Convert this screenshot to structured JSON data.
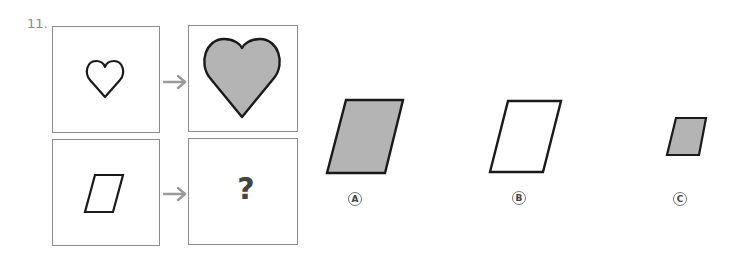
{
  "question": {
    "number": "11.",
    "matrix": {
      "top_left": {
        "shape": "heart",
        "fill": "none",
        "size": "small"
      },
      "top_right": {
        "shape": "heart",
        "fill": "gray",
        "size": "large"
      },
      "bottom_left": {
        "shape": "parallelogram",
        "fill": "none",
        "size": "small"
      },
      "bottom_right": {
        "content": "?"
      },
      "arrow_icon": "right-arrow"
    },
    "options": [
      {
        "label": "A",
        "shape": "parallelogram",
        "fill": "gray",
        "size": "large"
      },
      {
        "label": "B",
        "shape": "parallelogram",
        "fill": "none",
        "size": "large"
      },
      {
        "label": "C",
        "shape": "parallelogram",
        "fill": "gray",
        "size": "small"
      }
    ]
  },
  "colors": {
    "stroke": "#1a1a1a",
    "fill_gray": "#b4b4b4",
    "border": "#8c8c8c",
    "arrow": "#9a9a9a",
    "text": "#444444"
  }
}
